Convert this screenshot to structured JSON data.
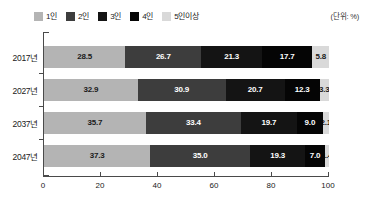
{
  "unit_note": "(단위: %)",
  "legend": {
    "items": [
      {
        "label": "1인",
        "color": "#b4b4b4"
      },
      {
        "label": "2인",
        "color": "#3d3d3d"
      },
      {
        "label": "3인",
        "color": "#141414"
      },
      {
        "label": "4인",
        "color": "#050505"
      },
      {
        "label": "5인이상",
        "color": "#d9d9d9"
      }
    ]
  },
  "chart_data": {
    "type": "bar",
    "orientation": "horizontal",
    "stacked": true,
    "title": "",
    "subtitle": "",
    "xlabel": "",
    "ylabel": "",
    "unit": "%",
    "xlim": [
      0,
      100
    ],
    "xticks": [
      0,
      20,
      40,
      60,
      80,
      100
    ],
    "xticklabels": [
      "0",
      "20",
      "40",
      "60",
      "80",
      "100"
    ],
    "grid": false,
    "legend_position": "top-left",
    "categories": [
      "2017년",
      "2027년",
      "2037년",
      "2047년"
    ],
    "series": [
      {
        "name": "1인",
        "color": "#b4b4b4",
        "text_color": "#1a1a1a",
        "values": [
          28.5,
          32.9,
          35.7,
          37.3
        ]
      },
      {
        "name": "2인",
        "color": "#3d3d3d",
        "text_color": "#ffffff",
        "values": [
          26.7,
          30.9,
          33.4,
          35.0
        ]
      },
      {
        "name": "3인",
        "color": "#141414",
        "text_color": "#ffffff",
        "values": [
          21.3,
          20.7,
          19.7,
          19.3
        ]
      },
      {
        "name": "4인",
        "color": "#050505",
        "text_color": "#ffffff",
        "values": [
          17.7,
          12.3,
          9.0,
          7.0
        ]
      },
      {
        "name": "5인이상",
        "color": "#d9d9d9",
        "text_color": "#1a1a1a",
        "values": [
          5.8,
          3.3,
          2.1,
          1.4
        ]
      }
    ],
    "value_labels": [
      [
        "28.5",
        "26.7",
        "21.3",
        "17.7",
        "5.8"
      ],
      [
        "32.9",
        "30.9",
        "20.7",
        "12.3",
        "3.3"
      ],
      [
        "35.7",
        "33.4",
        "19.7",
        "9.0",
        "2.1"
      ],
      [
        "37.3",
        "35.0",
        "19.3",
        "7.0",
        "1.4"
      ]
    ]
  }
}
